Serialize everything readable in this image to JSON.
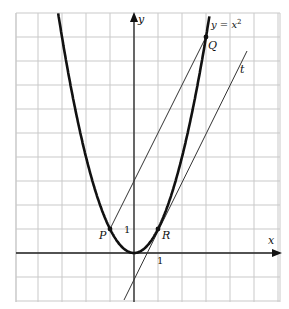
{
  "diagram": {
    "type": "function-graph",
    "origin_px": [
      134,
      253
    ],
    "unit_px": 24,
    "grid": {
      "x_min": -5,
      "x_max": 6,
      "y_min": -2,
      "y_max": 10
    },
    "axes": {
      "x_label": "x",
      "y_label": "y"
    },
    "tick_labels": {
      "x_one": "1",
      "y_one": "1"
    },
    "curve": {
      "label": "y = x",
      "superscript": "2",
      "equation": "y = x^2"
    },
    "points": [
      {
        "name": "P",
        "x": -1,
        "y": 1
      },
      {
        "name": "R",
        "x": 1,
        "y": 1
      },
      {
        "name": "Q",
        "x": 3,
        "y": 9
      }
    ],
    "lines": [
      {
        "name": "PQ",
        "equation": "y = 2x + 3",
        "from": [
          -1,
          1
        ],
        "to": [
          3,
          9
        ]
      },
      {
        "name": "t",
        "label": "t",
        "equation": "y = 2x - 1",
        "from": [
          -0.4,
          -1.8
        ],
        "to": [
          4.7,
          8.4
        ]
      }
    ]
  }
}
